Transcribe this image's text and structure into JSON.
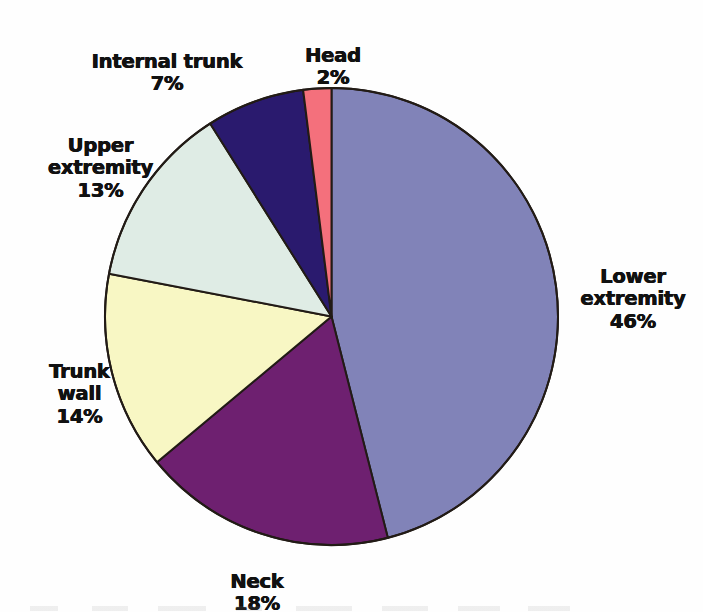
{
  "chart_data": {
    "type": "pie",
    "title": "",
    "subtitle": "",
    "xlabel": "",
    "ylabel": "",
    "legend_position": "none",
    "labels_position": "outside-callout",
    "grid": false,
    "units": "percent",
    "total": 100,
    "start_angle_deg": 0,
    "direction": "clockwise",
    "categories": [
      "Lower extremity",
      "Neck",
      "Trunk wall",
      "Upper extremity",
      "Internal trunk",
      "Head"
    ],
    "values": [
      46,
      18,
      14,
      13,
      7,
      2
    ],
    "colors": [
      "#8183b8",
      "#6e2070",
      "#f8f7c4",
      "#dfece5",
      "#2a1a6e",
      "#f4707c"
    ],
    "slices": [
      {
        "name": "lower-extremity",
        "label": "Lower\nextremity",
        "value": 46,
        "value_text": "46%",
        "color": "#8183b8",
        "start_deg": 0,
        "end_deg": 165.6
      },
      {
        "name": "neck",
        "label": "Neck",
        "value": 18,
        "value_text": "18%",
        "color": "#6e2070",
        "start_deg": 165.6,
        "end_deg": 230.4
      },
      {
        "name": "trunk-wall",
        "label": "Trunk\nwall",
        "value": 14,
        "value_text": "14%",
        "color": "#f8f7c4",
        "start_deg": 230.4,
        "end_deg": 280.8
      },
      {
        "name": "upper-extremity",
        "label": "Upper\nextremity",
        "value": 13,
        "value_text": "13%",
        "color": "#dfece5",
        "start_deg": 280.8,
        "end_deg": 327.6
      },
      {
        "name": "internal-trunk",
        "label": "Internal trunk",
        "value": 7,
        "value_text": "7%",
        "color": "#2a1a6e",
        "start_deg": 327.6,
        "end_deg": 352.8
      },
      {
        "name": "head",
        "label": "Head",
        "value": 2,
        "value_text": "2%",
        "color": "#f4707c",
        "start_deg": 352.8,
        "end_deg": 360
      }
    ],
    "stroke_color": "#221b16",
    "stroke_width": 2,
    "background": "#ffffff"
  },
  "labels": {
    "internal_trunk": {
      "name": "Internal trunk",
      "percent": "7%"
    },
    "head": {
      "name": "Head",
      "percent": "2%"
    },
    "upper_extremity": {
      "name": "Upper\nextremity",
      "percent": "13%"
    },
    "trunk_wall": {
      "name": "Trunk\nwall",
      "percent": "14%"
    },
    "lower_extremity": {
      "name": "Lower\nextremity",
      "percent": "46%"
    },
    "neck": {
      "name": "Neck",
      "percent": "18%"
    }
  }
}
